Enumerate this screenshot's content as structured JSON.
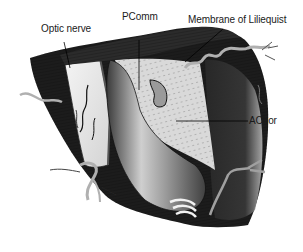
{
  "figure": {
    "labels": [
      {
        "id": "optic-nerve",
        "text": "Optic nerve"
      },
      {
        "id": "pcomm",
        "text": "PComm"
      },
      {
        "id": "membrane-of-liliequist",
        "text": "Membrane of Liliequist"
      },
      {
        "id": "achor",
        "text": "AChor"
      }
    ],
    "signature": "Illustrator signature"
  },
  "colors": {
    "background": "#ffffff",
    "dark_tissue": "#1c1c1c",
    "mid_tissue": "#5a5a5a",
    "light_tissue": "#e6e6e6",
    "artery_highlight": "#d8d8d8",
    "label_text": "#1a1a1a"
  }
}
